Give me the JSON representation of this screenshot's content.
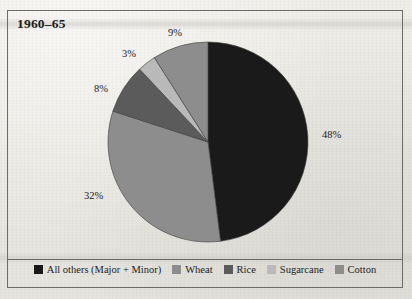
{
  "figure": {
    "title": "1960–65",
    "background_color": "#eceae4",
    "frame_color": "#6e6c68"
  },
  "chart_data": {
    "type": "pie",
    "title": "1960–65",
    "xlabel": "",
    "ylabel": "",
    "grid": false,
    "legend_position": "bottom",
    "start_angle_deg": 0,
    "direction": "clockwise",
    "categories": [
      "All others (Major + Minor)",
      "Wheat",
      "Rice",
      "Sugarcane",
      "Cotton"
    ],
    "values": [
      48,
      32,
      8,
      3,
      9
    ],
    "value_labels": [
      "48%",
      "32%",
      "8%",
      "3%",
      "9%"
    ],
    "colors": [
      "#1a1a1a",
      "#8d8d8d",
      "#5b5b5b",
      "#b9b9b9",
      "#8d8d8d"
    ],
    "total": 100,
    "units": "percent"
  },
  "slices": [
    {
      "name": "All others (Major + Minor)",
      "percent": 48,
      "label": "48%",
      "color": "#1a1a1a",
      "label_x": 322,
      "label_y": 129
    },
    {
      "name": "Wheat",
      "percent": 32,
      "label": "32%",
      "color": "#8d8d8d",
      "label_x": 84,
      "label_y": 190
    },
    {
      "name": "Rice",
      "percent": 8,
      "label": "8%",
      "color": "#5b5b5b",
      "label_x": 94,
      "label_y": 83
    },
    {
      "name": "Sugarcane",
      "percent": 3,
      "label": "3%",
      "color": "#b9b9b9",
      "label_x": 122,
      "label_y": 48
    },
    {
      "name": "Cotton",
      "percent": 9,
      "label": "9%",
      "color": "#8d8d8d",
      "label_x": 168,
      "label_y": 27
    }
  ],
  "legend": {
    "items": [
      {
        "label": "All others (Major + Minor)",
        "color": "#1a1a1a"
      },
      {
        "label": "Wheat",
        "color": "#8d8d8d"
      },
      {
        "label": "Rice",
        "color": "#5b5b5b"
      },
      {
        "label": "Sugarcane",
        "color": "#b9b9b9"
      },
      {
        "label": "Cotton",
        "color": "#8d8d8d"
      }
    ]
  }
}
